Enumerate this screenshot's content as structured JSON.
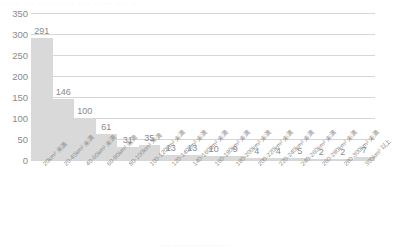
{
  "chart_data": {
    "type": "bar",
    "title": "",
    "xlabel": "",
    "ylabel": "",
    "ylim": [
      0,
      350
    ],
    "yticks": [
      0,
      50,
      100,
      150,
      200,
      250,
      300,
      350
    ],
    "grid": true,
    "legend": null,
    "bar_color": "#d9d9d9",
    "gridline_color": "#d6d6d6",
    "text_color": "#8a8a8a",
    "categories": [
      "20km² 未満",
      "20-40km² 未満",
      "40-60km² 未満",
      "60-80km² 未満",
      "80-100km² 未満",
      "100-120km² 未満",
      "120-140km² 未満",
      "140-160km² 未満",
      "160-180km² 未満",
      "180-200km² 未満",
      "200-220km² 未満",
      "220-240km² 未満",
      "240-260km² 未満",
      "260-280km² 未満",
      "280-300km² 未満",
      "300km² 以上"
    ],
    "values": [
      291,
      146,
      100,
      61,
      31,
      35,
      13,
      13,
      10,
      9,
      4,
      4,
      5,
      2,
      2,
      7
    ]
  },
  "fragments": {
    "top_cut_text": "··  ····  ··· ···   ···· ···  ····  ·· ··· ···· ··  ··",
    "bottom_cut_text": "····   ······ ············   ·····"
  }
}
